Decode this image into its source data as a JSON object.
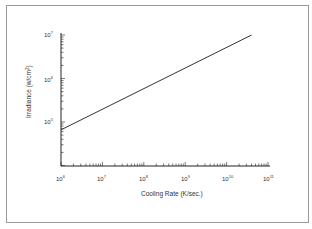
{
  "chart_data": {
    "type": "line",
    "title": "",
    "xlabel": "Cooling Rate (K/sec.)",
    "ylabel": "Irradiance (w/cm²)",
    "xscale": "log",
    "yscale": "log",
    "xlim": [
      1000000,
      100000000000
    ],
    "ylim": [
      10000,
      10000000
    ],
    "x_ticks": [
      "10^6",
      "10^7",
      "10^8",
      "10^9",
      "10^10",
      "10^11"
    ],
    "y_ticks": [
      "10^5",
      "10^6",
      "10^7"
    ],
    "grid": false,
    "legend": null,
    "series": [
      {
        "name": "Irradiance vs Cooling Rate",
        "x": [
          1000000,
          40000000000
        ],
        "y": [
          66000,
          10000000
        ]
      }
    ]
  },
  "labels": {
    "xlabel": "Cooling Rate (K/sec.)",
    "ylabel": "Irradiance (w/cm",
    "ylabel_sup": "2",
    "ylabel_end": ")",
    "x_ticks": [
      {
        "base": "10",
        "exp": "6"
      },
      {
        "base": "10",
        "exp": "7"
      },
      {
        "base": "10",
        "exp": "8"
      },
      {
        "base": "10",
        "exp": "9"
      },
      {
        "base": "10",
        "exp": "10"
      },
      {
        "base": "10",
        "exp": "11"
      }
    ],
    "y_ticks": [
      {
        "base": "10",
        "exp": "7"
      },
      {
        "base": "10",
        "exp": "6"
      },
      {
        "base": "10",
        "exp": "5"
      }
    ]
  }
}
